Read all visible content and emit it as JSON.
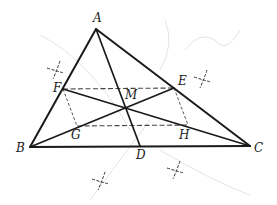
{
  "figure": {
    "colors": {
      "stroke": "#1a1a1a",
      "dashed": "#444444",
      "construction": "#333333",
      "background_ghost": "#e4e4e4"
    },
    "points": {
      "A": {
        "label": "A",
        "x": 96,
        "y": 29,
        "lx": 93,
        "ly": 22
      },
      "B": {
        "label": "B",
        "x": 30,
        "y": 147,
        "lx": 16,
        "ly": 152
      },
      "C": {
        "label": "C",
        "x": 250,
        "y": 146,
        "lx": 254,
        "ly": 152
      },
      "D": {
        "label": "D",
        "x": 140,
        "y": 146,
        "lx": 136,
        "ly": 159
      },
      "E": {
        "label": "E",
        "x": 174,
        "y": 88,
        "lx": 178,
        "ly": 85
      },
      "F": {
        "label": "F",
        "x": 63,
        "y": 89,
        "lx": 53,
        "ly": 92
      },
      "G": {
        "label": "G",
        "x": 77,
        "y": 126,
        "lx": 71,
        "ly": 139
      },
      "H": {
        "label": "H",
        "x": 188,
        "y": 125,
        "lx": 179,
        "ly": 139
      },
      "M": {
        "label": "M",
        "x": 125,
        "y": 107,
        "lx": 125,
        "ly": 99
      }
    },
    "solid_segments": [
      [
        "A",
        "B"
      ],
      [
        "A",
        "C"
      ],
      [
        "B",
        "C"
      ],
      [
        "A",
        "D"
      ],
      [
        "B",
        "E"
      ],
      [
        "C",
        "F"
      ]
    ],
    "dashed_segments": [
      [
        "F",
        "E"
      ],
      [
        "G",
        "H"
      ],
      [
        "F",
        "G"
      ],
      [
        "E",
        "H"
      ]
    ],
    "construction_marks": [
      {
        "x": 56,
        "y": 70
      },
      {
        "x": 203,
        "y": 79
      },
      {
        "x": 101,
        "y": 181
      },
      {
        "x": 176,
        "y": 170
      }
    ]
  }
}
